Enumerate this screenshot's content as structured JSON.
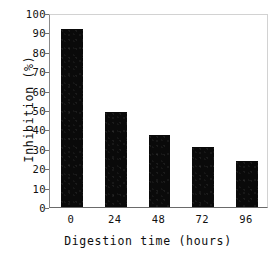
{
  "chart_data": {
    "type": "bar",
    "title": "",
    "categories": [
      "0",
      "24",
      "48",
      "72",
      "96"
    ],
    "values": [
      92,
      49,
      37,
      31,
      23.5
    ],
    "series": [
      {
        "name": "Inhibition",
        "values": [
          92,
          49,
          37,
          31,
          23.5
        ]
      }
    ],
    "xlabel": "Digestion time (hours)",
    "ylabel": "Inhibition (%)",
    "ylim": [
      0,
      100
    ],
    "yticks": [
      0,
      10,
      20,
      30,
      40,
      50,
      60,
      70,
      80,
      90,
      100
    ],
    "ytick_labels": [
      "0",
      "10",
      "20",
      "30",
      "40",
      "50",
      "60",
      "70",
      "80",
      "90",
      "100"
    ],
    "xtick_labels": [
      "0",
      "24",
      "48",
      "72",
      "96"
    ],
    "grid": false,
    "legend": false,
    "legend_position": "none",
    "bar_color": "#0a0a0a",
    "frame_color": "#d2d2d2",
    "axis_color": "#6a6a6a",
    "background_color": "#ffffff"
  }
}
